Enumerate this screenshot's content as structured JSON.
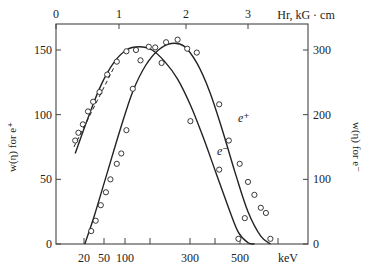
{
  "chart_data": {
    "type": "scatter",
    "title": "",
    "top_axis": {
      "label": "Hr, kG · cm",
      "ticks": [
        {
          "v": "0",
          "x": 56
        },
        {
          "v": "1",
          "x": 119
        },
        {
          "v": "2",
          "x": 186
        },
        {
          "v": "3",
          "x": 248
        }
      ]
    },
    "bottom_axis": {
      "label": "keV",
      "ticks": [
        {
          "v": "20",
          "x": 84
        },
        {
          "v": "50",
          "x": 104
        },
        {
          "v": "100",
          "x": 125
        },
        {
          "v": "",
          "x": 150
        },
        {
          "v": "300",
          "x": 190
        },
        {
          "v": "",
          "x": 215
        },
        {
          "v": "500",
          "x": 240
        },
        {
          "v": "",
          "x": 278
        }
      ],
      "scale": "Hr (nonlinear energy labels)"
    },
    "left_axis": {
      "label": "w(η) for e⁺",
      "ylim": [
        0,
        170
      ],
      "ticks": [
        {
          "v": "0",
          "val": 0
        },
        {
          "v": "50",
          "val": 50
        },
        {
          "v": "100",
          "val": 100
        },
        {
          "v": "150",
          "val": 150
        }
      ]
    },
    "right_axis": {
      "label": "w(η) for e⁻",
      "ylim": [
        0,
        340
      ],
      "ticks": [
        {
          "v": "0",
          "val": 0
        },
        {
          "v": "100",
          "val": 100
        },
        {
          "v": "200",
          "val": 200
        },
        {
          "v": "300",
          "val": 300
        }
      ]
    },
    "series": [
      {
        "name": "e⁺",
        "axis": "left",
        "label_pos": {
          "x": 238,
          "y": 122
        },
        "curve_Hr_vs_w": [
          [
            0.45,
            0
          ],
          [
            0.6,
            22
          ],
          [
            0.8,
            55
          ],
          [
            1.0,
            88
          ],
          [
            1.2,
            118
          ],
          [
            1.4,
            138
          ],
          [
            1.6,
            150
          ],
          [
            1.8,
            155
          ],
          [
            2.0,
            153
          ],
          [
            2.2,
            140
          ],
          [
            2.4,
            118
          ],
          [
            2.6,
            88
          ],
          [
            2.8,
            55
          ],
          [
            3.0,
            25
          ],
          [
            3.2,
            6
          ],
          [
            3.35,
            0
          ]
        ],
        "points_Hr_vs_w": [
          [
            0.55,
            10
          ],
          [
            0.62,
            18
          ],
          [
            0.7,
            30
          ],
          [
            0.78,
            40
          ],
          [
            0.85,
            50
          ],
          [
            0.95,
            62
          ],
          [
            1.02,
            70
          ],
          [
            1.1,
            88
          ],
          [
            1.2,
            120
          ],
          [
            1.32,
            142
          ],
          [
            1.55,
            152
          ],
          [
            1.72,
            156
          ],
          [
            1.9,
            158
          ],
          [
            2.05,
            151
          ],
          [
            2.2,
            148
          ],
          [
            2.55,
            108
          ],
          [
            2.7,
            80
          ],
          [
            2.87,
            62
          ],
          [
            3.0,
            48
          ],
          [
            3.1,
            38
          ],
          [
            3.2,
            28
          ],
          [
            3.28,
            24
          ],
          [
            2.95,
            20
          ],
          [
            3.35,
            4
          ]
        ]
      },
      {
        "name": "e⁻",
        "axis": "right",
        "label_pos": {
          "x": 217,
          "y": 155
        },
        "curve_Hr_vs_w": [
          [
            0.3,
            140
          ],
          [
            0.5,
            195
          ],
          [
            0.7,
            245
          ],
          [
            0.9,
            280
          ],
          [
            1.1,
            300
          ],
          [
            1.3,
            305
          ],
          [
            1.5,
            300
          ],
          [
            1.7,
            282
          ],
          [
            1.9,
            255
          ],
          [
            2.1,
            215
          ],
          [
            2.3,
            165
          ],
          [
            2.5,
            110
          ],
          [
            2.7,
            55
          ],
          [
            2.85,
            18
          ],
          [
            3.0,
            2
          ],
          [
            3.1,
            0
          ]
        ],
        "points_Hr_vs_w": [
          [
            0.3,
            160
          ],
          [
            0.35,
            172
          ],
          [
            0.42,
            185
          ],
          [
            0.5,
            205
          ],
          [
            0.58,
            220
          ],
          [
            0.68,
            235
          ],
          [
            0.8,
            262
          ],
          [
            0.95,
            282
          ],
          [
            1.1,
            298
          ],
          [
            1.25,
            300
          ],
          [
            1.45,
            305
          ],
          [
            1.65,
            280
          ],
          [
            2.1,
            190
          ],
          [
            2.55,
            115
          ],
          [
            2.85,
            8
          ]
        ]
      }
    ]
  }
}
